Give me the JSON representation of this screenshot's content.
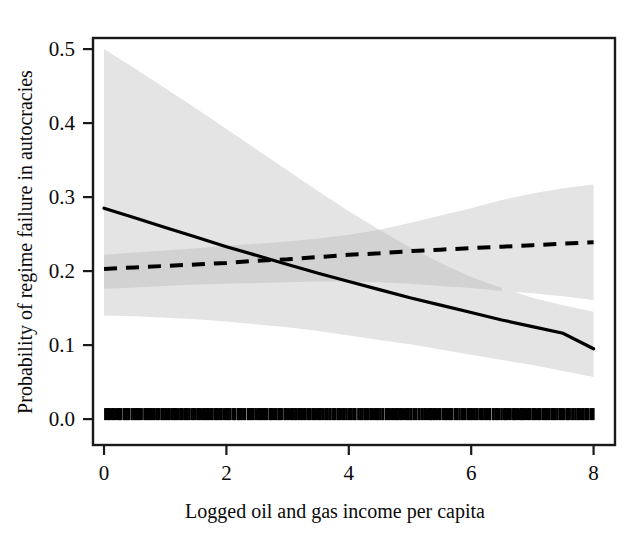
{
  "chart_data": {
    "type": "line",
    "title": "",
    "xlabel": "Logged oil and gas income per capita",
    "ylabel": "Probability of regime failure in autocracies",
    "xlim": [
      -0.18,
      8.35
    ],
    "ylim": [
      -0.035,
      0.515
    ],
    "xticks": [
      0,
      2,
      4,
      6,
      8
    ],
    "xticklabels": [
      "0",
      "2",
      "4",
      "6",
      "8"
    ],
    "yticks": [
      0.0,
      0.1,
      0.2,
      0.3,
      0.4,
      0.5
    ],
    "yticklabels": [
      "0.0",
      "0.1",
      "0.2",
      "0.3",
      "0.4",
      "0.5"
    ],
    "grid": false,
    "legend": "none",
    "frame": "box",
    "band_color": "#e4e4e4",
    "band_overlap_color": "#cfcfcf",
    "line_color": "#000000",
    "series": [
      {
        "name": "solid-curve",
        "style": "solid",
        "x": [
          0,
          0.5,
          1,
          1.5,
          2,
          2.5,
          3,
          3.5,
          4,
          4.5,
          5,
          5.5,
          6,
          6.5,
          7,
          7.5,
          8
        ],
        "values": [
          0.285,
          0.272,
          0.259,
          0.246,
          0.233,
          0.221,
          0.209,
          0.197,
          0.186,
          0.175,
          0.164,
          0.154,
          0.144,
          0.134,
          0.125,
          0.116,
          0.095
        ],
        "ci_lower": [
          0.14,
          0.139,
          0.137,
          0.135,
          0.132,
          0.128,
          0.124,
          0.119,
          0.113,
          0.107,
          0.101,
          0.094,
          0.087,
          0.08,
          0.073,
          0.065,
          0.057
        ],
        "ci_upper": [
          0.5,
          0.474,
          0.447,
          0.42,
          0.392,
          0.364,
          0.336,
          0.308,
          0.281,
          0.256,
          0.232,
          0.211,
          0.192,
          0.177,
          0.164,
          0.154,
          0.145
        ]
      },
      {
        "name": "dashed-curve",
        "style": "dashed",
        "x": [
          0,
          0.5,
          1,
          1.5,
          2,
          2.5,
          3,
          3.5,
          4,
          4.5,
          5,
          5.5,
          6,
          6.5,
          7,
          7.5,
          8
        ],
        "values": [
          0.203,
          0.205,
          0.207,
          0.209,
          0.211,
          0.214,
          0.216,
          0.219,
          0.222,
          0.224,
          0.227,
          0.229,
          0.231,
          0.233,
          0.235,
          0.237,
          0.239
        ],
        "ci_lower": [
          0.176,
          0.178,
          0.18,
          0.182,
          0.183,
          0.184,
          0.185,
          0.186,
          0.186,
          0.185,
          0.183,
          0.18,
          0.177,
          0.173,
          0.17,
          0.166,
          0.161
        ],
        "ci_upper": [
          0.222,
          0.225,
          0.228,
          0.231,
          0.234,
          0.237,
          0.24,
          0.244,
          0.249,
          0.256,
          0.265,
          0.275,
          0.285,
          0.296,
          0.305,
          0.312,
          0.317
        ]
      }
    ],
    "rug": {
      "name": "rug-marks",
      "axis": "x",
      "y_value": 0.0,
      "count": 430,
      "note": "dense black tick marks along the bottom axis spanning x = 0 to 8"
    }
  }
}
